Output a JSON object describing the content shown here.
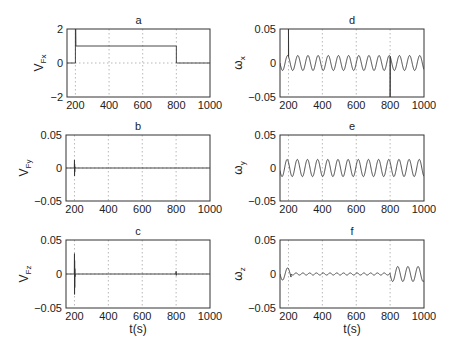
{
  "figure": {
    "width": 449,
    "height": 349,
    "background": "#ffffff",
    "line_color": "#333333",
    "grid_color": "#999999"
  },
  "chart_data": [
    {
      "id": "a",
      "type": "line",
      "title": "a",
      "ylabel": "V",
      "ylabel_sub": "Fx",
      "xlabel": "",
      "xlim": [
        150,
        1000
      ],
      "ylim": [
        -2,
        2
      ],
      "xticks": [
        200,
        400,
        600,
        800,
        1000
      ],
      "yticks": [
        -2,
        0,
        2
      ],
      "ytick_labels": [
        "−2",
        "0",
        "2"
      ],
      "grid": "dotted-vertical-and-zero",
      "box": {
        "x": 67,
        "y": 29,
        "w": 143,
        "h": 68
      },
      "series": [
        {
          "name": "V_Fx",
          "x": [
            150,
            199,
            200,
            200,
            202,
            203,
            800,
            800,
            803,
            1000
          ],
          "y": [
            0,
            0,
            0,
            2,
            2,
            1,
            1,
            0,
            0,
            0
          ]
        }
      ]
    },
    {
      "id": "b",
      "type": "line",
      "title": "b",
      "ylabel": "V",
      "ylabel_sub": "Fy",
      "xlabel": "",
      "xlim": [
        150,
        1000
      ],
      "ylim": [
        -0.05,
        0.05
      ],
      "xticks": [
        200,
        400,
        600,
        800,
        1000
      ],
      "yticks": [
        -0.05,
        0,
        0.05
      ],
      "ytick_labels": [
        "−0.05",
        "0",
        "0.05"
      ],
      "grid": "dotted-vertical-and-zero",
      "box": {
        "x": 66,
        "y": 135,
        "w": 144,
        "h": 66
      },
      "series": [
        {
          "name": "V_Fy",
          "x": [
            150,
            199,
            200,
            200.5,
            201,
            201.5,
            202,
            203,
            1000
          ],
          "y": [
            0,
            0,
            0.012,
            -0.012,
            0.006,
            -0.006,
            0.002,
            0,
            0
          ]
        }
      ]
    },
    {
      "id": "c",
      "type": "line",
      "title": "c",
      "ylabel": "V",
      "ylabel_sub": "Fz",
      "xlabel": "t(s)",
      "xlim": [
        150,
        1000
      ],
      "ylim": [
        -0.05,
        0.05
      ],
      "xticks": [
        200,
        400,
        600,
        800,
        1000
      ],
      "yticks": [
        -0.05,
        0,
        0.05
      ],
      "ytick_labels": [
        "−0.05",
        "0",
        "0.05"
      ],
      "grid": "dotted-vertical-and-zero",
      "box": {
        "x": 66,
        "y": 240,
        "w": 144,
        "h": 68
      },
      "series": [
        {
          "name": "V_Fz",
          "x": [
            150,
            199,
            200,
            200.5,
            201,
            201.5,
            202,
            203,
            204,
            799,
            800,
            801,
            802,
            1000
          ],
          "y": [
            0,
            0,
            0.03,
            -0.03,
            0.02,
            -0.02,
            0.008,
            -0.004,
            0,
            0,
            0.004,
            -0.002,
            0,
            0
          ]
        }
      ]
    },
    {
      "id": "d",
      "type": "line",
      "title": "d",
      "ylabel": "ω",
      "ylabel_sub": "x",
      "xlabel": "",
      "xlim": [
        150,
        1000
      ],
      "ylim": [
        -0.05,
        0.05
      ],
      "xticks": [
        200,
        400,
        600,
        800,
        1000
      ],
      "yticks": [
        -0.05,
        0,
        0.05
      ],
      "ytick_labels": [
        "−0.05",
        "0",
        "0.05"
      ],
      "grid": "dotted-vertical",
      "box": {
        "x": 280,
        "y": 29,
        "w": 144,
        "h": 68
      },
      "series": [
        {
          "name": "omega_x",
          "kind": "sine",
          "amplitude": 0.011,
          "period": 60,
          "phase": 0,
          "spikes": [
            {
              "x": 200,
              "y": 0.05
            },
            {
              "x": 800,
              "y": -0.05
            }
          ]
        }
      ]
    },
    {
      "id": "e",
      "type": "line",
      "title": "e",
      "ylabel": "ω",
      "ylabel_sub": "y",
      "xlabel": "",
      "xlim": [
        150,
        1000
      ],
      "ylim": [
        -0.05,
        0.05
      ],
      "xticks": [
        200,
        400,
        600,
        800,
        1000
      ],
      "yticks": [
        -0.05,
        0,
        0.05
      ],
      "ytick_labels": [
        "−0.05",
        "0",
        "0.05"
      ],
      "grid": "dotted-vertical",
      "box": {
        "x": 280,
        "y": 135,
        "w": 144,
        "h": 66
      },
      "series": [
        {
          "name": "omega_y",
          "kind": "sine",
          "amplitude": 0.013,
          "period": 60,
          "phase": 0.3,
          "spikes": []
        }
      ]
    },
    {
      "id": "f",
      "type": "line",
      "title": "f",
      "ylabel": "ω",
      "ylabel_sub": "z",
      "xlabel": "t(s)",
      "xlim": [
        150,
        1000
      ],
      "ylim": [
        -0.05,
        0.05
      ],
      "xticks": [
        200,
        400,
        600,
        800,
        1000
      ],
      "yticks": [
        -0.05,
        0,
        0.05
      ],
      "ytick_labels": [
        "−0.05",
        "0",
        "0.05"
      ],
      "grid": "dotted-vertical",
      "box": {
        "x": 280,
        "y": 240,
        "w": 144,
        "h": 68
      },
      "series": [
        {
          "name": "omega_z",
          "kind": "piecewise-sine",
          "segments": [
            {
              "from": 150,
              "to": 215,
              "amplitude": 0.009,
              "period": 60,
              "phase": 0
            },
            {
              "from": 215,
              "to": 800,
              "amplitude": 0.0015,
              "period": 40,
              "phase": 0
            },
            {
              "from": 800,
              "to": 1000,
              "amplitude": 0.011,
              "period": 60,
              "phase": 0
            }
          ]
        }
      ]
    }
  ]
}
